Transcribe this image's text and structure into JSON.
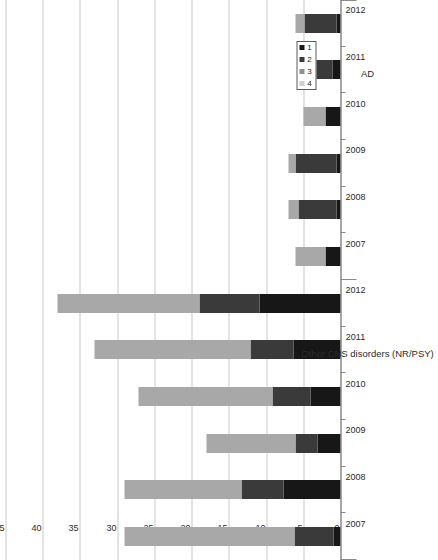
{
  "chart_data": {
    "type": "bar",
    "orientation": "horizontal-stacked",
    "title": "",
    "xlabel": "",
    "ylabel": "",
    "value_axis": {
      "min": 0,
      "max": 45,
      "ticks": [
        45,
        40,
        35,
        30,
        25,
        20,
        15,
        10,
        5,
        0
      ],
      "direction": "right-to-left",
      "grid": true
    },
    "legend": {
      "position": "bottom-left",
      "entries": [
        {
          "label": "1",
          "color": "#171717"
        },
        {
          "label": "2",
          "color": "#3a3a3a"
        },
        {
          "label": "3",
          "color": "#8f8f8f"
        },
        {
          "label": "4",
          "color": "#d0d0d0"
        }
      ]
    },
    "groups": [
      {
        "name": "AD",
        "categories": [
          "2007",
          "2008",
          "2009",
          "2010",
          "2011",
          "2012"
        ],
        "series": [
          {
            "name": "1",
            "color": "#171717",
            "values": [
              2.0,
              0.6,
              0.6,
              2.0,
              1.1,
              0.6
            ]
          },
          {
            "name": "2",
            "color": "#3a3a3a",
            "values": [
              0.0,
              5.0,
              5.4,
              0.0,
              3.0,
              4.2
            ]
          },
          {
            "name": "3",
            "color": "#a8a8a8",
            "values": [
              4.0,
              1.4,
              1.0,
              3.0,
              0.0,
              1.2
            ]
          },
          {
            "name": "4",
            "color": "#d8d8d8",
            "values": [
              0.0,
              0.0,
              0.0,
              0.0,
              0.0,
              0.0
            ]
          }
        ],
        "totals": [
          6.0,
          7.0,
          7.0,
          5.0,
          4.1,
          6.0
        ]
      },
      {
        "name": "Other CNS disorders (NR/PSY)",
        "categories": [
          "2007",
          "2008",
          "2009",
          "2010",
          "2011",
          "2012"
        ],
        "series": [
          {
            "name": "1",
            "color": "#171717",
            "values": [
              1.0,
              7.7,
              3.1,
              4.0,
              6.3,
              10.9
            ]
          },
          {
            "name": "2",
            "color": "#3a3a3a",
            "values": [
              5.2,
              5.6,
              2.9,
              5.1,
              5.8,
              8.0
            ]
          },
          {
            "name": "3",
            "color": "#a8a8a8",
            "values": [
              22.8,
              15.7,
              12.0,
              18.0,
              20.9,
              19.1
            ]
          },
          {
            "name": "4",
            "color": "#d8d8d8",
            "values": [
              0.0,
              0.0,
              0.0,
              0.0,
              0.0,
              0.0
            ]
          }
        ],
        "totals": [
          29.0,
          29.0,
          18.0,
          27.1,
          33.0,
          38.0
        ]
      }
    ]
  },
  "axis": {
    "value_ticks": [
      "45",
      "40",
      "35",
      "30",
      "25",
      "20",
      "15",
      "10",
      "5",
      "0"
    ],
    "category_labels_ad": [
      "2007",
      "2008",
      "2009",
      "2010",
      "2011",
      "2012"
    ],
    "category_labels_cns": [
      "2007",
      "2008",
      "2009",
      "2010",
      "2011",
      "2012"
    ],
    "group_label_ad": "AD",
    "group_label_cns": "Other CNS disorders (NR/PSY)"
  },
  "legend": {
    "items": [
      "1",
      "2",
      "3",
      "4"
    ]
  }
}
